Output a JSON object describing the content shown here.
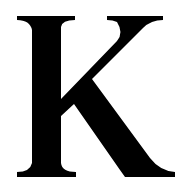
{
  "glyph": {
    "character": "K",
    "style": "serif",
    "color": "#000000",
    "background": "#ffffff"
  }
}
